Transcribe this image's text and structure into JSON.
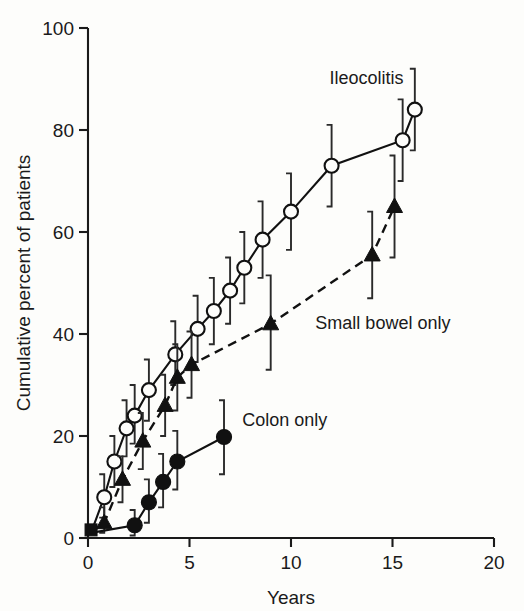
{
  "chart_data": {
    "type": "line",
    "title": "",
    "xlabel": "Years",
    "ylabel": "Cumulative percent of patients",
    "xlim": [
      0,
      20
    ],
    "ylim": [
      0,
      100
    ],
    "xticks": [
      0,
      5,
      10,
      15,
      20
    ],
    "yticks": [
      0,
      20,
      40,
      60,
      80,
      100
    ],
    "grid": false,
    "legend_position": "inline-annotations",
    "series": [
      {
        "name": "Ileocolitis",
        "marker": "open-circle",
        "line_style": "solid",
        "label_x": 11.9,
        "label_y": 89,
        "points": [
          {
            "x": 0.15,
            "y": 1.0,
            "err_low": 1.0,
            "err_high": 1.0
          },
          {
            "x": 0.8,
            "y": 8.0,
            "err_low": 4.0,
            "err_high": 12.5
          },
          {
            "x": 1.3,
            "y": 15.0,
            "err_low": 10.0,
            "err_high": 20.0
          },
          {
            "x": 1.9,
            "y": 21.5,
            "err_low": 16.0,
            "err_high": 27.0
          },
          {
            "x": 2.3,
            "y": 24.0,
            "err_low": 18.5,
            "err_high": 30.0
          },
          {
            "x": 3.0,
            "y": 29.0,
            "err_low": 23.0,
            "err_high": 35.0
          },
          {
            "x": 4.3,
            "y": 36.0,
            "err_low": 30.0,
            "err_high": 42.5
          },
          {
            "x": 5.4,
            "y": 41.0,
            "err_low": 34.5,
            "err_high": 47.5
          },
          {
            "x": 6.2,
            "y": 44.5,
            "err_low": 38.0,
            "err_high": 51.0
          },
          {
            "x": 7.0,
            "y": 48.5,
            "err_low": 42.0,
            "err_high": 55.0
          },
          {
            "x": 7.7,
            "y": 53.0,
            "err_low": 46.0,
            "err_high": 60.0
          },
          {
            "x": 8.6,
            "y": 58.5,
            "err_low": 51.0,
            "err_high": 66.0
          },
          {
            "x": 10.0,
            "y": 64.0,
            "err_low": 56.5,
            "err_high": 71.5
          },
          {
            "x": 12.0,
            "y": 73.0,
            "err_low": 65.0,
            "err_high": 81.0
          },
          {
            "x": 15.5,
            "y": 78.0,
            "err_low": 70.0,
            "err_high": 86.0
          },
          {
            "x": 16.1,
            "y": 84.0,
            "err_low": 76.0,
            "err_high": 92.0
          }
        ]
      },
      {
        "name": "Small bowel only",
        "marker": "filled-triangle",
        "line_style": "dashed",
        "label_x": 11.2,
        "label_y": 41,
        "points": [
          {
            "x": 0.15,
            "y": 1.0,
            "err_low": 1.0,
            "err_high": 1.0
          },
          {
            "x": 0.8,
            "y": 3.0,
            "err_low": 1.0,
            "err_high": 6.0
          },
          {
            "x": 1.7,
            "y": 11.5,
            "err_low": 7.0,
            "err_high": 16.0
          },
          {
            "x": 2.7,
            "y": 19.0,
            "err_low": 13.5,
            "err_high": 24.5
          },
          {
            "x": 3.8,
            "y": 26.0,
            "err_low": 20.0,
            "err_high": 32.0
          },
          {
            "x": 4.4,
            "y": 31.5,
            "err_low": 25.0,
            "err_high": 38.0
          },
          {
            "x": 5.1,
            "y": 34.0,
            "err_low": 27.5,
            "err_high": 40.5
          },
          {
            "x": 9.0,
            "y": 42.0,
            "err_low": 33.0,
            "err_high": 51.5
          },
          {
            "x": 14.0,
            "y": 55.5,
            "err_low": 47.0,
            "err_high": 64.0
          },
          {
            "x": 15.1,
            "y": 65.0,
            "err_low": 55.0,
            "err_high": 75.0
          }
        ]
      },
      {
        "name": "Colon only",
        "marker": "filled-circle",
        "line_style": "solid",
        "label_x": 7.6,
        "label_y": 22,
        "points": [
          {
            "x": 0.15,
            "y": 1.0,
            "err_low": 1.0,
            "err_high": 1.0
          },
          {
            "x": 2.3,
            "y": 2.5,
            "err_low": 0.5,
            "err_high": 5.5
          },
          {
            "x": 3.0,
            "y": 7.0,
            "err_low": 3.0,
            "err_high": 11.5
          },
          {
            "x": 3.7,
            "y": 11.0,
            "err_low": 6.0,
            "err_high": 16.5
          },
          {
            "x": 4.4,
            "y": 15.0,
            "err_low": 9.5,
            "err_high": 21.0
          },
          {
            "x": 6.7,
            "y": 19.8,
            "err_low": 12.5,
            "err_high": 27.0
          }
        ]
      }
    ],
    "origin_marker": {
      "shape": "filled-square",
      "x": 0.15,
      "y": 1.0
    }
  }
}
